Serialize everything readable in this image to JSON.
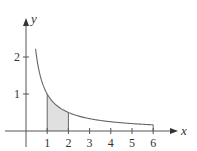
{
  "chart_data": {
    "type": "area",
    "function": "y = 1/x",
    "title": "",
    "xlabel": "x",
    "ylabel": "y",
    "x_ticks": [
      1,
      2,
      3,
      4,
      5,
      6
    ],
    "y_ticks": [
      1,
      2
    ],
    "xlim": [
      0,
      6.6
    ],
    "ylim": [
      0,
      2.3
    ],
    "curve": {
      "x_start": 0.45,
      "x_end": 6,
      "points": [
        {
          "x": 0.45,
          "y": 2.22
        },
        {
          "x": 0.5,
          "y": 2.0
        },
        {
          "x": 0.75,
          "y": 1.333
        },
        {
          "x": 1,
          "y": 1.0
        },
        {
          "x": 1.5,
          "y": 0.667
        },
        {
          "x": 2,
          "y": 0.5
        },
        {
          "x": 3,
          "y": 0.333
        },
        {
          "x": 4,
          "y": 0.25
        },
        {
          "x": 5,
          "y": 0.2
        },
        {
          "x": 6,
          "y": 0.167
        }
      ]
    },
    "shaded_region": {
      "x_from": 1,
      "x_to": 2,
      "color": "#e0e0e0"
    },
    "extra_line": {
      "description": "vertical segment at x=6 from axis to curve",
      "x": 6
    },
    "grid": false,
    "legend": null
  },
  "labels": {
    "x_axis": "x",
    "y_axis": "y",
    "x_ticks": [
      "1",
      "2",
      "3",
      "4",
      "5",
      "6"
    ],
    "y_ticks": [
      "1",
      "2"
    ]
  },
  "colors": {
    "axis": "#555555",
    "curve": "#666666",
    "shade": "#e0e0e0"
  }
}
